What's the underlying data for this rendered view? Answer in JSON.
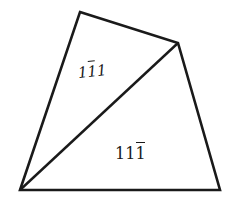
{
  "diagram": {
    "type": "quadrilateral-split-by-diagonal",
    "vertices": {
      "top": [
        80,
        12
      ],
      "upper_right": [
        178,
        43
      ],
      "bottom_left": [
        20,
        190
      ],
      "bottom_right": [
        220,
        190
      ]
    },
    "stroke_color": "#1a1a1a",
    "regions": [
      {
        "name": "upper-left-triangle",
        "label_digits": [
          "1",
          "1",
          "1"
        ],
        "label_bars": [
          false,
          true,
          false
        ],
        "label_text": "1̄1 (11̄1)",
        "style": "italic"
      },
      {
        "name": "lower-right-triangle",
        "label_digits": [
          "1",
          "1",
          "1"
        ],
        "label_bars": [
          false,
          false,
          true
        ],
        "label_text": "111̄",
        "style": "upright"
      }
    ]
  }
}
